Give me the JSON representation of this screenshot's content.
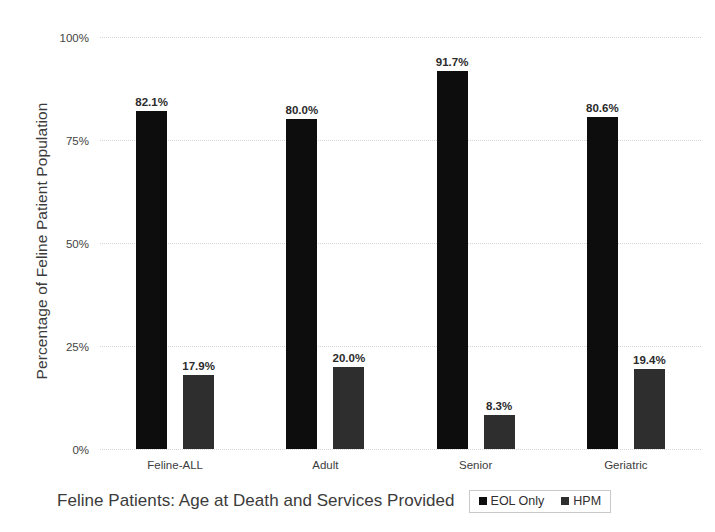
{
  "chart_data": {
    "type": "bar",
    "title": "",
    "xlabel": "Feline Patients: Age at Death and Services Provided",
    "ylabel": "Percentage of Feline Patient Population",
    "categories": [
      "Feline-ALL",
      "Adult",
      "Senior",
      "Geriatric"
    ],
    "series": [
      {
        "name": "EOL Only",
        "color": "#0d0d0d",
        "values": [
          82.1,
          80.0,
          91.7,
          80.6
        ],
        "labels": [
          "82.1%",
          "80.0%",
          "91.7%",
          "80.6%"
        ]
      },
      {
        "name": "HPM",
        "color": "#2e2e2e",
        "values": [
          17.9,
          20.0,
          8.3,
          19.4
        ],
        "labels": [
          "17.9%",
          "20.0%",
          "8.3%",
          "19.4%"
        ]
      }
    ],
    "ylim": [
      0,
      100
    ],
    "yticks": [
      0,
      25,
      50,
      75,
      100
    ],
    "ytick_labels": [
      "0%",
      "25%",
      "50%",
      "75%",
      "100%"
    ],
    "grid": true,
    "legend_position": "bottom-right"
  },
  "axes": {
    "y_title": "Percentage of Feline Patient Population",
    "x_title": "Feline Patients: Age at Death and Services Provided"
  },
  "legend": {
    "items": [
      {
        "label": "EOL Only",
        "color": "#0d0d0d"
      },
      {
        "label": "HPM",
        "color": "#2e2e2e"
      }
    ]
  }
}
